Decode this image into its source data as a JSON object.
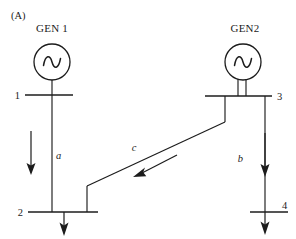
{
  "figure": {
    "panel_tag": "(A)",
    "background_color": "#ffffff",
    "line_color": "#1c1c1c"
  },
  "generators": [
    {
      "id": "gen1",
      "label": "GEN 1",
      "symbol": "ac-source-sine",
      "connected_bus": "1",
      "cx": 52,
      "cy": 62,
      "r": 18,
      "leads": 1
    },
    {
      "id": "gen2",
      "label": "GEN2",
      "symbol": "ac-source-sine",
      "connected_bus": "3",
      "cx": 243,
      "cy": 62,
      "r": 18,
      "leads": 2
    }
  ],
  "buses": [
    {
      "id": "bus1",
      "label": "1",
      "label_side": "left",
      "y": 95,
      "x1": 25,
      "x2": 73
    },
    {
      "id": "bus3",
      "label": "3",
      "label_side": "right",
      "y": 96,
      "x1": 205,
      "x2": 272
    },
    {
      "id": "bus2",
      "label": "2",
      "label_side": "left",
      "y": 212,
      "x1": 28,
      "x2": 98
    },
    {
      "id": "bus4",
      "label": "4",
      "label_side": "right",
      "y": 212,
      "x1": 250,
      "x2": 288
    }
  ],
  "branches": [
    {
      "id": "branch-a",
      "label": "a",
      "from_bus": "1",
      "to_bus": "2",
      "flow_direction": "down",
      "label_x": 56,
      "label_y": 156
    },
    {
      "id": "branch-b",
      "label": "b",
      "from_bus": "3",
      "to_bus": "4",
      "flow_direction": "down",
      "label_x": 239,
      "label_y": 159
    },
    {
      "id": "branch-c",
      "label": "c",
      "from_bus": "3",
      "to_bus": "2",
      "flow_direction": "down-left",
      "label_x": 131,
      "label_y": 150
    }
  ],
  "loads": [
    {
      "id": "load-bus2",
      "at_bus": "2",
      "direction": "down"
    },
    {
      "id": "load-bus4",
      "at_bus": "4",
      "direction": "down"
    }
  ]
}
